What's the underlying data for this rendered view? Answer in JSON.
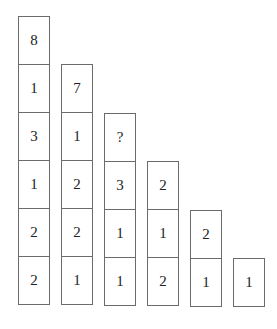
{
  "diagram": {
    "type": "number-pyramid-columns",
    "columns": [
      {
        "cells": [
          "8",
          "1",
          "3",
          "1",
          "2",
          "2"
        ]
      },
      {
        "cells": [
          "7",
          "1",
          "2",
          "2",
          "1"
        ]
      },
      {
        "cells": [
          "?",
          "3",
          "1",
          "1"
        ]
      },
      {
        "cells": [
          "2",
          "1",
          "2"
        ]
      },
      {
        "cells": [
          "2",
          "1"
        ]
      },
      {
        "cells": [
          "1"
        ]
      }
    ]
  }
}
